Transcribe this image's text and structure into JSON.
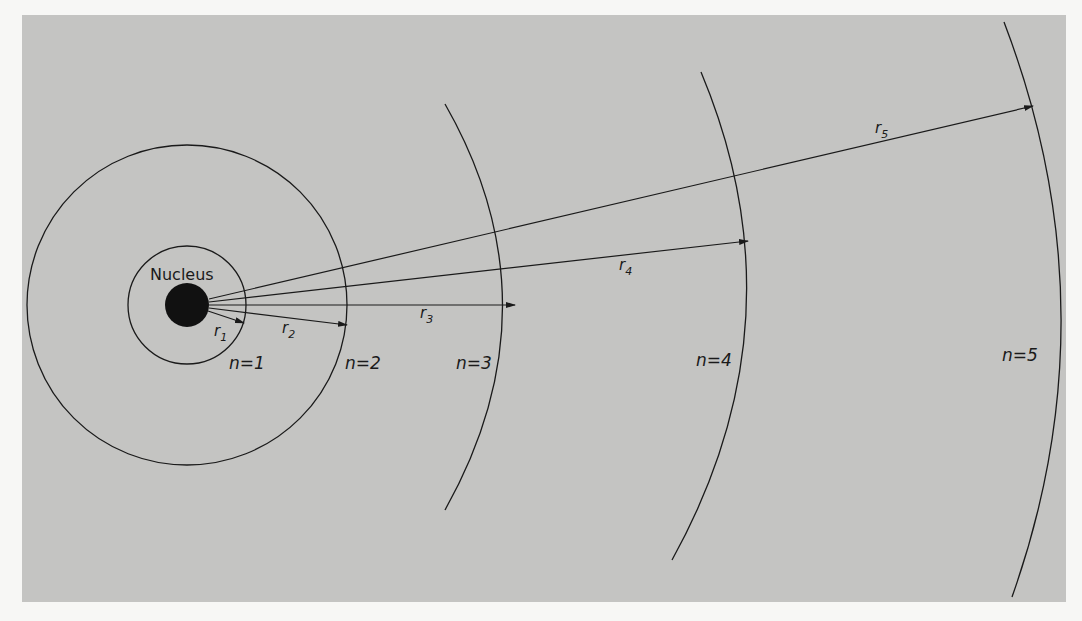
{
  "diagram": {
    "colors": {
      "panel": "#c4c4c2",
      "page": "#f7f7f5",
      "ink": "#1a1a1a"
    },
    "nucleus": {
      "label": "Nucleus",
      "cx": 187,
      "cy": 305,
      "r": 22
    },
    "orbits": [
      {
        "n_label": "n=1",
        "radius": 59
      },
      {
        "n_label": "n=2",
        "radius": 160
      },
      {
        "n_label": "n=3",
        "radius": 328
      },
      {
        "n_label": "n=4",
        "radius": 565
      },
      {
        "n_label": "n=5",
        "radius": 872
      }
    ],
    "radii_labels": [
      {
        "label": "r",
        "sub": "1"
      },
      {
        "label": "r",
        "sub": "2"
      },
      {
        "label": "r",
        "sub": "3"
      },
      {
        "label": "r",
        "sub": "4"
      },
      {
        "label": "r",
        "sub": "5"
      }
    ]
  }
}
